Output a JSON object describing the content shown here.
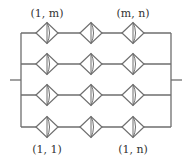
{
  "diagram": {
    "title": "",
    "rows": 4,
    "columns": 3,
    "row_y": [
      33,
      64,
      95,
      127
    ],
    "column_x": [
      47,
      91,
      133
    ],
    "left_bus_x": 21,
    "right_bus_x": 171,
    "terminal_y": 80,
    "left_terminal_x": 10,
    "right_terminal_x": 182,
    "diamond_half_width": 11,
    "diamond_half_height": 10.5,
    "stroke_color": "#6e6e6e",
    "labels": {
      "top_left": "(1, m)",
      "top_right": "(m, n)",
      "bottom_left": "(1, 1)",
      "bottom_right": "(1, n)"
    }
  }
}
